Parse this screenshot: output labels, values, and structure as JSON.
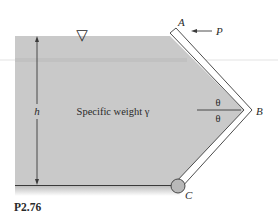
{
  "figure": {
    "caption": "P2.76",
    "fluid_label": "Specific weight γ",
    "depth_label": "h",
    "point_labels": {
      "A": "A",
      "B": "B",
      "C": "C"
    },
    "force_label": "P",
    "angle_labels": {
      "upper": "θ",
      "lower": "θ"
    },
    "free_surface_symbol": "▽",
    "colors": {
      "fluid": "#c9c9c9",
      "gate_fill": "#ffffff",
      "line": "#3a3a3a",
      "hinge": "#b8b8b8"
    }
  }
}
